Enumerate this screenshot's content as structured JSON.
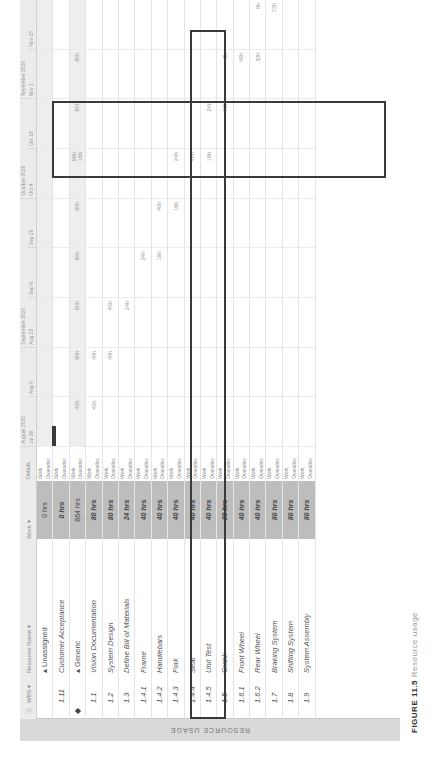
{
  "view": {
    "side_label": "RESOURCE USAGE",
    "caption_prefix": "FIGURE 11.5",
    "caption_rest": "Resource usage"
  },
  "table": {
    "headers": {
      "indicator": "ⓘ",
      "wbs": "WBS ▾",
      "name": "Resource Name ▾",
      "work": "Work ▾"
    },
    "rows": [
      {
        "ind": "",
        "wbs": "",
        "name": "▴ Unassigned",
        "work": "0 hrs",
        "group": true
      },
      {
        "ind": "",
        "wbs": "1.11",
        "name": "Customer Acceptance",
        "work": "0 hrs",
        "group": false
      },
      {
        "ind": "◆",
        "wbs": "",
        "name": "▴ Generic",
        "work": "864 hrs",
        "group": true
      },
      {
        "ind": "",
        "wbs": "1.1",
        "name": "Vision Documentation",
        "work": "80 hrs",
        "group": false
      },
      {
        "ind": "",
        "wbs": "1.2",
        "name": "System Design",
        "work": "80 hrs",
        "group": false
      },
      {
        "ind": "",
        "wbs": "1.3",
        "name": "Define Bill of Materials",
        "work": "24 hrs",
        "group": false
      },
      {
        "ind": "",
        "wbs": "1.4.1",
        "name": "Frame",
        "work": "40 hrs",
        "group": false
      },
      {
        "ind": "",
        "wbs": "1.4.2",
        "name": "Handlebars",
        "work": "40 hrs",
        "group": false
      },
      {
        "ind": "",
        "wbs": "1.4.3",
        "name": "Fork",
        "work": "40 hrs",
        "group": false
      },
      {
        "ind": "",
        "wbs": "1.4.4",
        "name": "Seat",
        "work": "40 hrs",
        "group": false
      },
      {
        "ind": "",
        "wbs": "1.4.5",
        "name": "Unit Test",
        "work": "40 hrs",
        "group": false
      },
      {
        "ind": "",
        "wbs": "1.5",
        "name": "Crank",
        "work": "80 hrs",
        "group": false
      },
      {
        "ind": "",
        "wbs": "1.6.1",
        "name": "Front Wheel",
        "work": "40 hrs",
        "group": false
      },
      {
        "ind": "",
        "wbs": "1.6.2",
        "name": "Rear Wheel",
        "work": "40 hrs",
        "group": false
      },
      {
        "ind": "",
        "wbs": "1.7",
        "name": "Braking System",
        "work": "80 hrs",
        "group": false
      },
      {
        "ind": "",
        "wbs": "1.8",
        "name": "Shifting System",
        "work": "80 hrs",
        "group": false
      },
      {
        "ind": "",
        "wbs": "1.9",
        "name": "System Assembly",
        "work": "80 hrs",
        "group": false
      }
    ]
  },
  "details": {
    "header": "Details",
    "work_label": "Work",
    "overalloc_label": "Overalloc"
  },
  "timeline": {
    "months": [
      {
        "label": "August 2020",
        "span": 2
      },
      {
        "label": "September 2020",
        "span": 3
      },
      {
        "label": "October 2020",
        "span": 2
      },
      {
        "label": "November 2020",
        "span": 2
      }
    ],
    "weeks": [
      "Jul 26",
      "Aug 9",
      "Aug 23",
      "Sep 6",
      "Sep 20",
      "Oct 4",
      "Oct 18",
      "Nov 1",
      "Nov 15"
    ],
    "rows": [
      [
        "",
        "",
        "",
        "",
        "",
        "",
        "",
        "",
        ""
      ],
      [
        "",
        "",
        "",
        "",
        "",
        "",
        "",
        "",
        ""
      ],
      [
        "40h",
        "80h",
        "80h",
        "80h",
        "80h",
        "96h",
        "80h",
        "80h",
        ""
      ],
      [
        "40h",
        "40h",
        "",
        "",
        "",
        "",
        "",
        "",
        ""
      ],
      [
        "",
        "40h",
        "40h",
        "",
        "",
        "",
        "",
        "",
        ""
      ],
      [
        "",
        "",
        "24h",
        "",
        "",
        "",
        "",
        "",
        ""
      ],
      [
        "",
        "",
        "",
        "24h",
        "",
        "",
        "",
        "",
        ""
      ],
      [
        "",
        "",
        "",
        "16h",
        "40h",
        "",
        "",
        "",
        ""
      ],
      [
        "",
        "",
        "",
        "",
        "16h",
        "24h",
        "",
        "",
        ""
      ],
      [
        "",
        "",
        "",
        "",
        "",
        "40h",
        "",
        "",
        ""
      ],
      [
        "",
        "",
        "",
        "",
        "",
        "16h",
        "24h",
        "",
        ""
      ],
      [
        "",
        "",
        "",
        "",
        "",
        "",
        "72h",
        "8h",
        ""
      ],
      [
        "",
        "",
        "",
        "",
        "",
        "",
        "",
        "40h",
        ""
      ],
      [
        "",
        "",
        "",
        "",
        "",
        "",
        "",
        "32h",
        "8h"
      ],
      [
        "",
        "",
        "",
        "",
        "",
        "",
        "",
        "",
        "72h"
      ],
      [
        "",
        "",
        "",
        "",
        "",
        "",
        "",
        "",
        ""
      ],
      [
        "",
        "",
        "",
        "",
        "",
        "",
        "",
        "",
        ""
      ]
    ],
    "overalloc_row2": "16h"
  },
  "annotations": {
    "box_color": "#3a3a3a"
  }
}
